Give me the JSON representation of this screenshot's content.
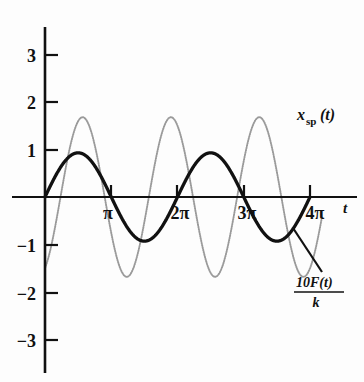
{
  "chart_data": {
    "type": "line",
    "title": "",
    "xlabel": "t",
    "ylabel": "",
    "xlim": [
      -0.25,
      14.4
    ],
    "ylim": [
      -3.6,
      3.6
    ],
    "grid": false,
    "legend": "inline-annotations",
    "x_ticks": [
      {
        "value": 3.14159,
        "label": "π"
      },
      {
        "value": 6.28319,
        "label": "2π"
      },
      {
        "value": 9.42478,
        "label": "3π"
      },
      {
        "value": 12.56637,
        "label": "4π"
      }
    ],
    "y_ticks": [
      {
        "value": 3,
        "label": "3"
      },
      {
        "value": 2,
        "label": "2"
      },
      {
        "value": 1,
        "label": "1"
      },
      {
        "value": -1,
        "label": "−1"
      },
      {
        "value": -2,
        "label": "−2"
      },
      {
        "value": -3,
        "label": "−3"
      }
    ],
    "series": [
      {
        "name": "x_sp(t)",
        "label_main": "x",
        "label_sub": "sp",
        "label_tail": "(t)",
        "color": "#111111",
        "style": "solid-thick",
        "function": "0.93*sin(t)",
        "amplitude": 0.93,
        "period": 6.28319,
        "phase": 0
      },
      {
        "name": "10F(t)/k",
        "label_numerator": "10F(t)",
        "label_denominator": "k",
        "color": "#9a9a9a",
        "style": "dotted-thin",
        "function": "1.68*sin(3*t/2 - 1.15)",
        "amplitude": 1.68,
        "period": 4.18879,
        "cycles_shown": 6,
        "value_at_zero": -1.5
      }
    ],
    "annotations": [
      {
        "text": "x_sp(t)",
        "x": 12.9,
        "y": 2.1,
        "for": "x_sp(t)"
      },
      {
        "text": "10F(t)/k",
        "x": 13.0,
        "y": -2.2,
        "for": "10F(t)/k",
        "leader_line": true
      }
    ]
  },
  "axis": {
    "t_symbol": "t"
  }
}
